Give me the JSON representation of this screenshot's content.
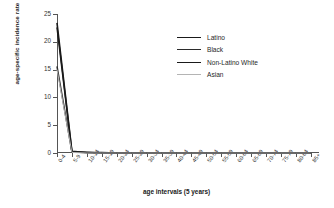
{
  "chart_data": {
    "type": "line",
    "title": "",
    "xlabel": "age intervals (5 years)",
    "ylabel": "age-specific incidence rate",
    "categories": [
      "0-4",
      "5-9",
      "10-14",
      "15-19",
      "20-24",
      "25-29",
      "30-34",
      "35-39",
      "40-44",
      "45-49",
      "50-54",
      "55-59",
      "60-64",
      "65-69",
      "70-74",
      "75-79",
      "80-84",
      "85+"
    ],
    "ylim": [
      0,
      25
    ],
    "yticks": [
      0,
      5,
      10,
      15,
      20,
      25
    ],
    "grid": false,
    "legend_position": "top-right",
    "series": [
      {
        "name": "Latino",
        "color": "#1a1a1a",
        "width": 1.6,
        "values": [
          23.4,
          0.3,
          0.1,
          0.1,
          0.0,
          0.0,
          0.0,
          0.0,
          0.0,
          0.0,
          0.0,
          0.0,
          0.0,
          0.0,
          0.0,
          0.0,
          0.0,
          0.0
        ]
      },
      {
        "name": "Black",
        "color": "#2b2b2b",
        "width": 1.5,
        "values": [
          15.6,
          0.2,
          0.1,
          0.0,
          0.0,
          0.0,
          0.0,
          0.0,
          0.0,
          0.0,
          0.0,
          0.0,
          0.0,
          0.0,
          0.0,
          0.0,
          0.0,
          0.0
        ]
      },
      {
        "name": "Non-Latino White",
        "color": "#1a1a1a",
        "width": 1.5,
        "values": [
          22.6,
          0.2,
          0.1,
          0.0,
          0.0,
          0.0,
          0.0,
          0.0,
          0.0,
          0.0,
          0.0,
          0.0,
          0.0,
          0.0,
          0.0,
          0.0,
          0.0,
          0.0
        ]
      },
      {
        "name": "Asian",
        "color": "#b4b4b4",
        "width": 1.0,
        "values": [
          15.0,
          0.1,
          0.0,
          0.0,
          0.0,
          0.0,
          0.0,
          0.0,
          0.0,
          0.0,
          0.0,
          0.0,
          0.0,
          0.0,
          0.0,
          0.0,
          0.0,
          0.0
        ]
      }
    ]
  }
}
